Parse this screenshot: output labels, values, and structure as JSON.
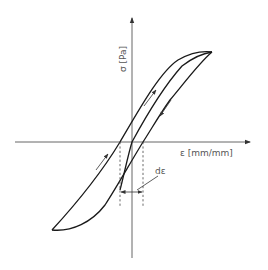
{
  "diagram": {
    "type": "stress-strain hysteresis loop",
    "y_axis_label": "σ [Pa]",
    "x_axis_label": "ε [mm/mm]",
    "width_label": "dε",
    "colors": {
      "background": "#ffffff",
      "curve": "#1a1a1a",
      "axis": "#555555",
      "label": "#555555"
    },
    "elements": {
      "axes": [
        "horizontal strain axis with arrow",
        "vertical stress axis with arrow"
      ],
      "curves": [
        "outer loading branch",
        "inner middle branch",
        "unloading branch"
      ],
      "arrows": [
        "upward arrow on middle branch",
        "downward arrow on right branch",
        "upward arrow on lower-left branch"
      ],
      "annotations": [
        "two dashed vertical lines marking residual strain",
        "double-headed dimension arrow labeled dε"
      ]
    }
  }
}
